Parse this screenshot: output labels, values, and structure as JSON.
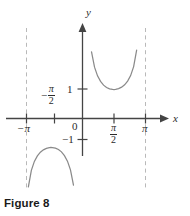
{
  "figure": {
    "caption": "Figure 8",
    "axis_labels": {
      "x": "x",
      "y": "y"
    },
    "tick_labels": {
      "x_neg_pi": "−π",
      "x_neg_half_pi_sign": "−",
      "x_neg_half_pi_num": "π",
      "x_neg_half_pi_den": "2",
      "x_half_pi_num": "π",
      "x_half_pi_den": "2",
      "x_pi": "π",
      "origin": "0",
      "y_one": "1",
      "y_neg_one": "−1"
    },
    "colors": {
      "curve": "#8a8a8a",
      "axis": "#444444",
      "asymptote": "#b9b9b9",
      "text": "#2b2b2b",
      "caption": "#1a1a1a",
      "background": "#ffffff"
    }
  },
  "chart_data": {
    "type": "line",
    "title": "Figure 8",
    "function": "y = csc x",
    "xlabel": "x",
    "ylabel": "y",
    "xlim": [
      -3.4557519,
      3.4557519
    ],
    "ylim": [
      -4.2,
      4.2
    ],
    "grid": false,
    "legend": null,
    "x_ticks": [
      -3.14159265,
      -1.57079633,
      0,
      1.57079633,
      3.14159265
    ],
    "x_tick_labels": [
      "−π",
      "−π/2",
      "0",
      "π/2",
      "π"
    ],
    "y_ticks": [
      -1,
      1
    ],
    "y_tick_labels": [
      "−1",
      "1"
    ],
    "asymptotes": {
      "vertical": [
        -3.14159265,
        3.14159265
      ],
      "style": "dashed"
    },
    "series": [
      {
        "name": "csc x (branch on (-π, 0))",
        "x": [
          -3.05,
          -2.95,
          -2.85,
          -2.7,
          -2.55,
          -2.4,
          -2.25,
          -2.1,
          -1.95,
          -1.8,
          -1.65,
          -1.5708,
          -1.5,
          -1.35,
          -1.2,
          -1.05,
          -0.9,
          -0.75,
          -0.6,
          -0.45,
          -0.3,
          -0.2,
          -0.12
        ],
        "y": [
          -10.95,
          -5.46,
          -3.58,
          -2.36,
          -1.79,
          -1.48,
          -1.29,
          -1.16,
          -1.08,
          -1.03,
          -1.004,
          -1.0,
          -1.002,
          -1.02,
          -1.07,
          -1.15,
          -1.28,
          -1.47,
          -1.77,
          -2.3,
          -3.38,
          -5.03,
          -8.35
        ]
      },
      {
        "name": "csc x (branch on (0, π))",
        "x": [
          0.12,
          0.2,
          0.3,
          0.45,
          0.6,
          0.75,
          0.9,
          1.05,
          1.2,
          1.35,
          1.5,
          1.5708,
          1.65,
          1.8,
          1.95,
          2.1,
          2.25,
          2.4,
          2.55,
          2.7,
          2.85,
          2.95,
          3.05
        ],
        "y": [
          8.35,
          5.03,
          3.38,
          2.3,
          1.77,
          1.47,
          1.28,
          1.15,
          1.07,
          1.02,
          1.002,
          1.0,
          1.004,
          1.03,
          1.08,
          1.16,
          1.29,
          1.48,
          1.79,
          2.36,
          3.58,
          5.46,
          10.95
        ]
      }
    ],
    "annotations": [
      {
        "text": "y",
        "role": "y-axis-label"
      },
      {
        "text": "x",
        "role": "x-axis-label"
      },
      {
        "text": "0",
        "role": "origin-label"
      }
    ]
  }
}
